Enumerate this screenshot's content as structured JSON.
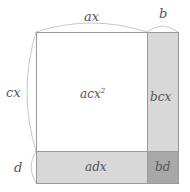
{
  "diagram": {
    "title": "",
    "top_labels": {
      "width_main": "ax",
      "width_extra": "b"
    },
    "side_labels": {
      "height_main": "cx",
      "height_extra": "d"
    },
    "cells": {
      "main": {
        "label": "acx",
        "superscript": "2",
        "color": "#ffffff"
      },
      "right": {
        "label": "bcx",
        "color": "#d8d8d8"
      },
      "bottom": {
        "label": "adx",
        "color": "#d8d8d8"
      },
      "corner": {
        "label": "bd",
        "color": "#a8a8a8"
      }
    },
    "colors": {
      "border": "#9a9a9a",
      "brace": "#c8c8c8",
      "text": "#555555"
    }
  }
}
